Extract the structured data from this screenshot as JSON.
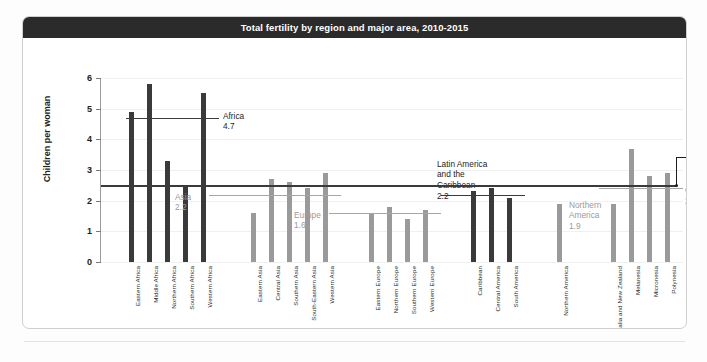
{
  "card": {
    "title": "Total fertility by region and major area, 2010-2015"
  },
  "chart_data": {
    "type": "bar",
    "title": "Total fertility by region and major area, 2010-2015",
    "xlabel": "",
    "ylabel": "Children per woman",
    "ylim": [
      0,
      6
    ],
    "yticks": [
      "0",
      "1",
      "2",
      "3",
      "4",
      "5",
      "6"
    ],
    "grid": true,
    "legend": "none",
    "categories": [
      "Eastern Africa",
      "Middle Africa",
      "Northern Africa",
      "Southern Africa",
      "Western Africa",
      "Eastern Asia",
      "Central Asia",
      "Southern Asia",
      "South-Eastern Asia",
      "Western Asia",
      "Eastern Europe",
      "Northern Europe",
      "Southern Europe",
      "Western Europe",
      "Caribbean",
      "Central America",
      "South America",
      "Northern America",
      "Australia and New Zealand",
      "Melanesia",
      "Micronesia",
      "Polynesia"
    ],
    "values": [
      4.9,
      5.8,
      3.3,
      2.5,
      5.5,
      1.6,
      2.7,
      2.6,
      2.4,
      2.9,
      1.6,
      1.8,
      1.4,
      1.7,
      2.3,
      2.4,
      2.1,
      1.9,
      1.9,
      3.7,
      2.8,
      2.9
    ],
    "bar_colors": [
      "dark",
      "dark",
      "dark",
      "dark",
      "dark",
      "gray",
      "gray",
      "gray",
      "gray",
      "gray",
      "gray",
      "gray",
      "gray",
      "gray",
      "dark",
      "dark",
      "dark",
      "gray",
      "gray",
      "gray",
      "gray",
      "gray"
    ],
    "region_averages": [
      {
        "name": "Africa",
        "value": 4.7,
        "label_value": "4.7",
        "style": "dark"
      },
      {
        "name": "Asia",
        "value": 2.2,
        "label_value": "2.2",
        "style": "gray"
      },
      {
        "name": "Europe",
        "value": 1.6,
        "label_value": "1.6",
        "style": "gray"
      },
      {
        "name": "Latin America\nand the\nCaribbean",
        "value": 2.2,
        "label_value": "2.2",
        "style": "dark"
      },
      {
        "name": "Northern\nAmerica",
        "value": 1.9,
        "label_value": "1.9",
        "style": "gray"
      },
      {
        "name": "Oceania",
        "value": 2.4,
        "label_value": "2.4",
        "style": "gray"
      },
      {
        "name": "World",
        "value": 2.5,
        "label_value": "2.5",
        "style": "bold"
      }
    ],
    "colors": {
      "bar_dark": "#3a3a3a",
      "bar_gray": "#9a9a9a",
      "title_bar": "#2b2b2b",
      "grid": "#f0f0f0"
    }
  },
  "axis": {
    "y_title": "Children per woman",
    "ticks": [
      "6",
      "5",
      "4",
      "3",
      "2",
      "1",
      "0"
    ]
  },
  "annotations": {
    "africa_label": "Africa",
    "africa_value": "4.7",
    "asia_label": "Asia",
    "asia_value": "2.2",
    "europe_label": "Europe",
    "europe_value": "1.6",
    "latam_label": "Latin America\nand the\nCaribbean",
    "latam_value": "2.2",
    "northern_america_label": "Northern\nAmerica",
    "northern_america_value": "1.9",
    "oceania_label": "Oceania",
    "oceania_value": "2.4",
    "world_label": "World",
    "world_value": "2.5"
  }
}
